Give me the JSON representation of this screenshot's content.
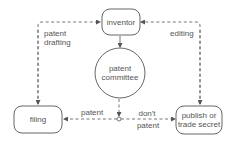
{
  "diagram": {
    "nodes": {
      "inventor": "inventor",
      "committee_line1": "patent",
      "committee_line2": "committee",
      "filing": "filing",
      "publish_line1": "publish or",
      "publish_line2": "trade secret"
    },
    "edges": {
      "patent_drafting_line1": "patent",
      "patent_drafting_line2": "drafting",
      "editing": "editing",
      "patent": "patent",
      "dont_patent_line1": "don't",
      "dont_patent_line2": "patent"
    },
    "colors": {
      "stroke": "#666666",
      "text": "#555555"
    }
  }
}
